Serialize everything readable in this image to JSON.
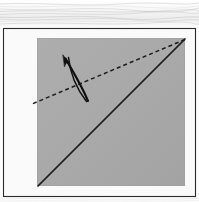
{
  "figure": {
    "background": {
      "name": "wood-grain-surface",
      "color": "#fbfbfb",
      "grain_color": "#c8c8c8",
      "band_height_px": 27
    },
    "frame": {
      "name": "diagram-frame",
      "stroke": "#2a2a2a",
      "fill": "#fafafa",
      "x": 3,
      "y": 28,
      "width": 193,
      "height": 169
    },
    "paper": {
      "name": "paper-square",
      "fill": "#a9a9a9",
      "edge": "#9d9d9d",
      "x": 37,
      "y": 38,
      "width": 148,
      "height": 148
    },
    "crease_line": {
      "name": "solid-crease-line",
      "style": "solid",
      "stroke": "#181818",
      "width_px": 1.6,
      "from": [
        185,
        39
      ],
      "to": [
        38,
        186
      ],
      "label": "existing crease"
    },
    "fold_line": {
      "name": "dashed-fold-line",
      "style": "dashed",
      "stroke": "#1b1b1b",
      "width_px": 1.5,
      "dash_pattern": "4 3",
      "from": [
        185,
        39
      ],
      "to": [
        32,
        104
      ],
      "label": "valley fold"
    },
    "fold_arrow": {
      "name": "fold-direction-arrow",
      "stroke": "#101010",
      "tip": [
        63,
        56
      ],
      "tail": [
        88,
        101
      ],
      "label": "fold direction"
    }
  }
}
